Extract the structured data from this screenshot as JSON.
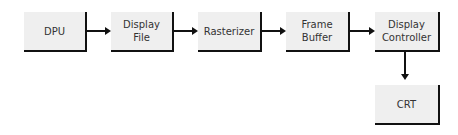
{
  "diagram": {
    "nodes": [
      {
        "id": "dpu",
        "label": "DPU"
      },
      {
        "id": "display-file",
        "label": "Display\nFile"
      },
      {
        "id": "rasterizer",
        "label": "Rasterizer"
      },
      {
        "id": "frame-buffer",
        "label": "Frame\nBuffer"
      },
      {
        "id": "display-controller",
        "label": "Display\nController"
      },
      {
        "id": "crt",
        "label": "CRT"
      }
    ],
    "edges": [
      {
        "from": "dpu",
        "to": "display-file"
      },
      {
        "from": "display-file",
        "to": "rasterizer"
      },
      {
        "from": "rasterizer",
        "to": "frame-buffer"
      },
      {
        "from": "frame-buffer",
        "to": "display-controller"
      },
      {
        "from": "display-controller",
        "to": "crt"
      }
    ]
  }
}
